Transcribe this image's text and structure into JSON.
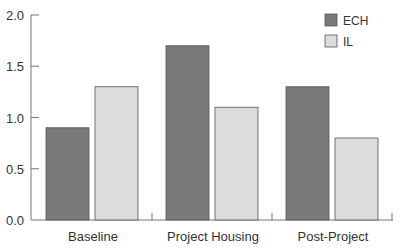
{
  "chart_data": {
    "type": "bar",
    "title": "",
    "xlabel": "",
    "ylabel": "",
    "categories": [
      "Baseline",
      "Project Housing",
      "Post-Project"
    ],
    "series": [
      {
        "name": "ECH",
        "values": [
          0.9,
          1.7,
          1.3
        ],
        "color": "#7a7a7a"
      },
      {
        "name": "IL",
        "values": [
          1.3,
          1.1,
          0.8
        ],
        "color": "#dcdcdc"
      }
    ],
    "ylim": [
      0,
      2.0
    ],
    "yticks": [
      "0.0",
      "0.5",
      "1.0",
      "1.5",
      "2.0"
    ],
    "grid": false,
    "legend_position": "top-right"
  },
  "legend": {
    "items": [
      {
        "label": "ECH",
        "color": "#7a7a7a"
      },
      {
        "label": "IL",
        "color": "#dcdcdc"
      }
    ]
  },
  "axis": {
    "y_ticks": [
      "0.0",
      "0.5",
      "1.0",
      "1.5",
      "2.0"
    ],
    "x_labels": [
      "Baseline",
      "Project Housing",
      "Post-Project"
    ]
  }
}
